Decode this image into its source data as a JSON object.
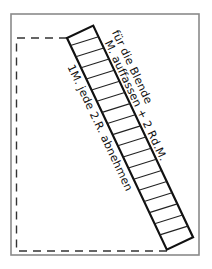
{
  "diagram": {
    "type": "knitting-schematic",
    "labels": {
      "outer_1": "für die Blende",
      "outer_2": "M. auffassen + 2 Rd.M.",
      "inner": "1M. jede 2.R. abnehmen"
    },
    "strip": {
      "hatch_count": 18,
      "description": "diagonal band (Blende) with hatching"
    },
    "outline": {
      "style": "dashed",
      "description": "dashed piece outline inside solid frame"
    }
  }
}
